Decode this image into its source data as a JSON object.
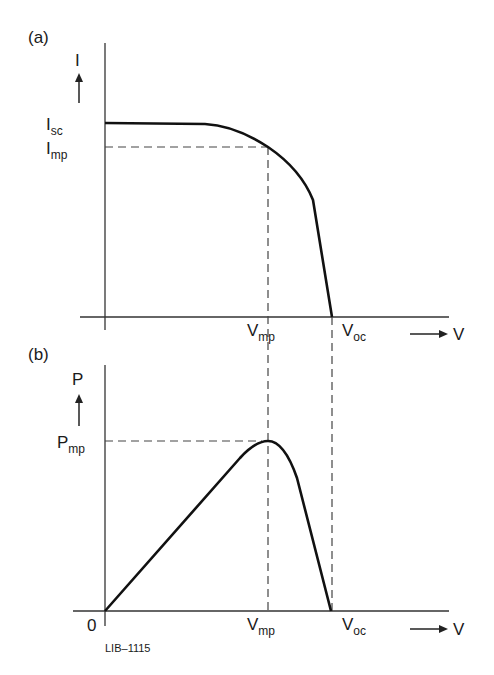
{
  "figure": {
    "panel_a": {
      "label": "(a)",
      "y_axis_label": "I",
      "x_axis_label": "V",
      "y_ticks": [
        {
          "main": "I",
          "sub": "sc"
        },
        {
          "main": "I",
          "sub": "mp"
        }
      ],
      "x_ticks": [
        {
          "main": "V",
          "sub": "mp"
        },
        {
          "main": "V",
          "sub": "oc"
        }
      ]
    },
    "panel_b": {
      "label": "(b)",
      "y_axis_label": "P",
      "x_axis_label": "V",
      "origin_label": "0",
      "y_ticks": [
        {
          "main": "P",
          "sub": "mp"
        }
      ],
      "x_ticks": [
        {
          "main": "V",
          "sub": "mp"
        },
        {
          "main": "V",
          "sub": "oc"
        }
      ]
    },
    "code_label": "LIB–1115"
  },
  "colors": {
    "curve": "#111111",
    "axis": "#333333",
    "dashed": "#444444"
  }
}
